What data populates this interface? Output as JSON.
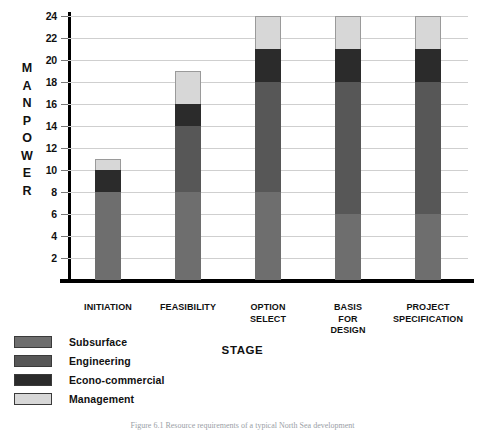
{
  "chart_data": {
    "type": "bar",
    "subtype": "stacked",
    "title": "",
    "xlabel": "STAGE",
    "ylabel": "MANPOWER",
    "ylim": [
      0,
      24
    ],
    "ytick_step": 2,
    "yticks": [
      24,
      22,
      20,
      18,
      16,
      14,
      12,
      10,
      8,
      6,
      4,
      2
    ],
    "grid": true,
    "legend_position": "bottom-left",
    "categories": [
      "INITIATION",
      "FEASIBILITY",
      "OPTION SELECT",
      "BASIS FOR DESIGN",
      "PROJECT SPECIFICATION"
    ],
    "series": [
      {
        "name": "Subsurface",
        "color": "#6e6e6e",
        "values": [
          8,
          8,
          8,
          6,
          6
        ]
      },
      {
        "name": "Engineering",
        "color": "#575757",
        "values": [
          0,
          6,
          10,
          12,
          12
        ]
      },
      {
        "name": "Econo-commercial",
        "color": "#2b2b2b",
        "values": [
          2,
          2,
          3,
          3,
          3
        ]
      },
      {
        "name": "Management",
        "color": "#d7d7d7",
        "values": [
          1,
          3,
          3,
          3,
          3
        ]
      }
    ],
    "totals": [
      11,
      19,
      24,
      24,
      24
    ]
  },
  "axis": {
    "y_title_letters": [
      "M",
      "A",
      "N",
      "P",
      "O",
      "W",
      "E",
      "R"
    ],
    "x_title": "STAGE"
  },
  "xlabels": [
    [
      "INITIATION"
    ],
    [
      "FEASIBILITY"
    ],
    [
      "OPTION",
      "SELECT"
    ],
    [
      "BASIS",
      "FOR",
      "DESIGN"
    ],
    [
      "PROJECT",
      "SPECIFICATION"
    ]
  ],
  "legend": {
    "items": [
      {
        "label": "Subsurface",
        "color": "#6e6e6e"
      },
      {
        "label": "Engineering",
        "color": "#575757"
      },
      {
        "label": "Econo-commercial",
        "color": "#2b2b2b"
      },
      {
        "label": "Management",
        "color": "#d7d7d7"
      }
    ]
  },
  "caption": "Figure 6.1  Resource requirements of a typical North Sea development"
}
